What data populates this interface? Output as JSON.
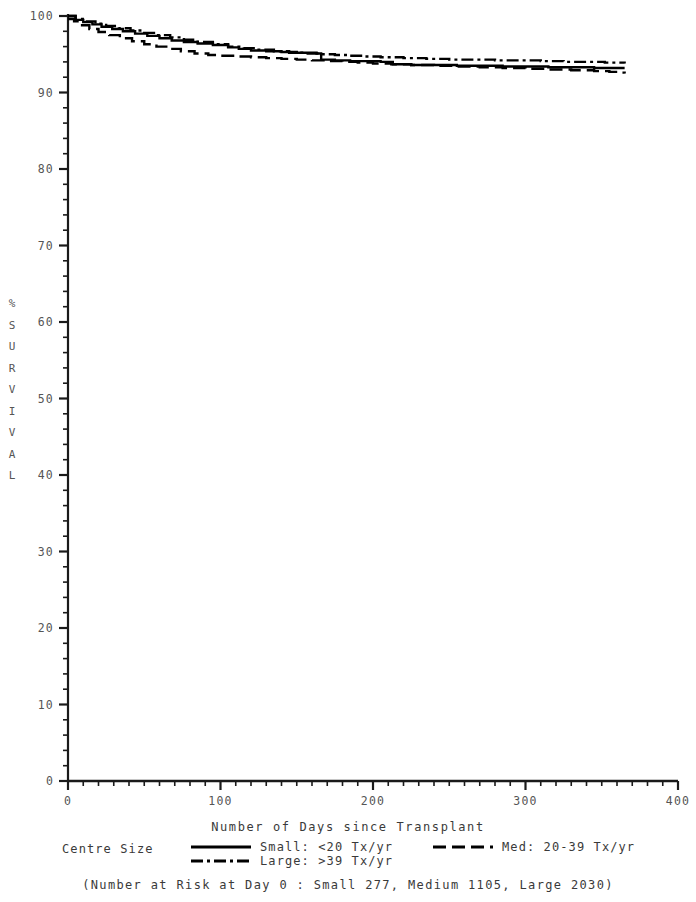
{
  "chart_data": {
    "type": "line",
    "title": "",
    "subtitle": "",
    "xlabel": "Number of Days since Transplant",
    "ylabel": "% SURVIVAL",
    "xlim": [
      0,
      400
    ],
    "ylim": [
      0,
      100
    ],
    "grid": false,
    "legend_position": "bottom",
    "legend_title": "Centre Size",
    "xticks": [
      0,
      100,
      200,
      300,
      400
    ],
    "xtick_labels": [
      "0",
      "100",
      "200",
      "300",
      "400"
    ],
    "x_minor_tick_step": 10,
    "yticks": [
      0,
      10,
      20,
      30,
      40,
      50,
      60,
      70,
      80,
      90,
      100
    ],
    "ytick_labels": [
      "0",
      "10",
      "20",
      "30",
      "40",
      "50",
      "60",
      "70",
      "80",
      "90",
      "100"
    ],
    "y_minor_tick_step": 2,
    "curve_kind": "kaplan-meier-step",
    "series": [
      {
        "name": "Small: <20 Tx/yr",
        "linestyle": "solid",
        "color": "#000000",
        "n_at_risk_day0": 277,
        "x": [
          0,
          5,
          10,
          16,
          22,
          29,
          36,
          44,
          52,
          60,
          68,
          76,
          85,
          95,
          105,
          112,
          120,
          130,
          140,
          150,
          160,
          163,
          166,
          175,
          185,
          195,
          205,
          213,
          225,
          240,
          255,
          270,
          285,
          300,
          315,
          330,
          345,
          355,
          365
        ],
        "y": [
          100.0,
          99.5,
          99.2,
          98.9,
          98.6,
          98.3,
          98.0,
          97.7,
          97.4,
          97.1,
          96.8,
          96.6,
          96.4,
          96.2,
          95.9,
          95.7,
          95.5,
          95.4,
          95.3,
          95.2,
          95.2,
          95.1,
          94.3,
          94.2,
          94.1,
          94.1,
          94.0,
          93.7,
          93.6,
          93.6,
          93.5,
          93.5,
          93.4,
          93.4,
          93.3,
          93.3,
          93.2,
          93.2,
          93.2
        ]
      },
      {
        "name": "Med: 20-39 Tx/yr",
        "linestyle": "dashed",
        "color": "#000000",
        "n_at_risk_day0": 1105,
        "x": [
          0,
          4,
          8,
          14,
          20,
          27,
          34,
          42,
          50,
          58,
          66,
          74,
          83,
          92,
          100,
          110,
          120,
          130,
          140,
          150,
          160,
          170,
          180,
          190,
          200,
          212,
          225,
          240,
          255,
          270,
          285,
          300,
          315,
          330,
          345,
          355,
          362,
          365
        ],
        "y": [
          99.6,
          99.3,
          98.8,
          98.3,
          97.9,
          97.5,
          97.1,
          96.7,
          96.3,
          96.0,
          95.7,
          95.4,
          95.1,
          94.9,
          94.8,
          94.7,
          94.6,
          94.5,
          94.4,
          94.3,
          94.2,
          94.1,
          94.0,
          93.9,
          93.8,
          93.7,
          93.6,
          93.5,
          93.4,
          93.3,
          93.2,
          93.1,
          93.0,
          92.9,
          92.8,
          92.7,
          92.6,
          92.5
        ]
      },
      {
        "name": "Large: >39 Tx/yr",
        "linestyle": "dashdot",
        "color": "#000000",
        "n_at_risk_day0": 2030,
        "x": [
          0,
          5,
          11,
          18,
          25,
          33,
          41,
          50,
          58,
          67,
          76,
          85,
          95,
          105,
          115,
          125,
          135,
          145,
          155,
          165,
          175,
          185,
          195,
          205,
          220,
          235,
          250,
          265,
          280,
          295,
          310,
          325,
          340,
          352,
          360,
          365
        ],
        "y": [
          100.0,
          99.6,
          99.3,
          99.0,
          98.7,
          98.4,
          98.1,
          97.8,
          97.5,
          97.2,
          96.9,
          96.6,
          96.3,
          96.0,
          95.8,
          95.6,
          95.4,
          95.2,
          95.1,
          95.0,
          94.9,
          94.8,
          94.7,
          94.6,
          94.5,
          94.4,
          94.3,
          94.3,
          94.2,
          94.2,
          94.1,
          94.0,
          94.0,
          93.9,
          93.9,
          93.8
        ]
      }
    ],
    "annotations": [
      "(Number at Risk at Day 0 : Small 277, Medium 1105, Large 2030)"
    ]
  },
  "legend": {
    "title": "Centre Size",
    "entries": [
      {
        "label": "Small: <20 Tx/yr",
        "style": "solid"
      },
      {
        "label": "Med: 20-39 Tx/yr",
        "style": "dashed"
      },
      {
        "label": "Large: >39 Tx/yr",
        "style": "dashdot"
      }
    ]
  },
  "axes": {
    "x_title": "Number of Days since Transplant",
    "y_title_chars": [
      "%",
      "S",
      "U",
      "R",
      "V",
      "I",
      "V",
      "A",
      "L"
    ]
  },
  "footnote": "(Number at Risk at Day 0 : Small 277, Medium 1105, Large 2030)",
  "colors": {
    "line": "#000000",
    "axis": "#1a1a1a",
    "text": "#3a3a3a"
  }
}
